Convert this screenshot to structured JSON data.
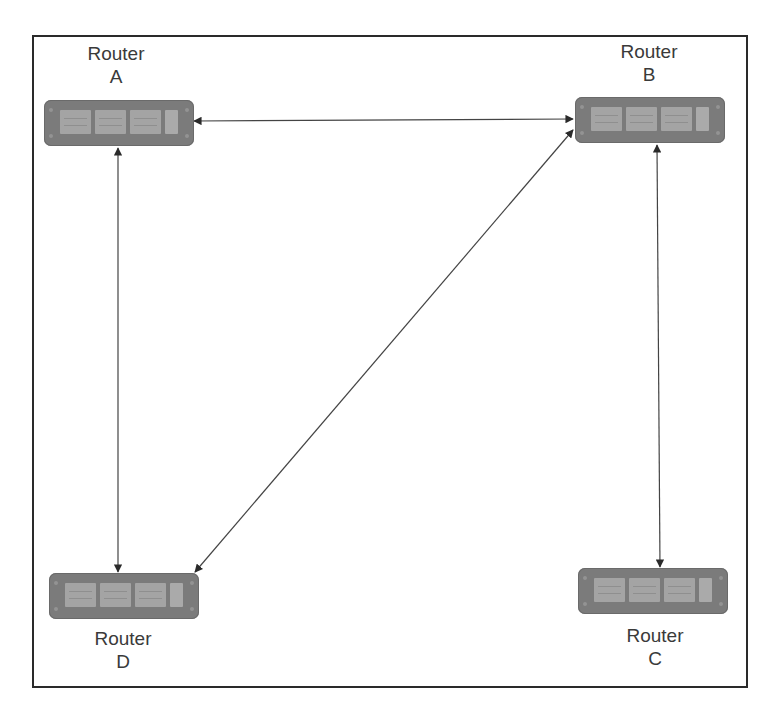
{
  "diagram": {
    "type": "network-topology",
    "routers": [
      {
        "id": "A",
        "label_line1": "Router",
        "label_line2": "A"
      },
      {
        "id": "B",
        "label_line1": "Router",
        "label_line2": "B"
      },
      {
        "id": "C",
        "label_line1": "Router",
        "label_line2": "C"
      },
      {
        "id": "D",
        "label_line1": "Router",
        "label_line2": "D"
      }
    ],
    "links": [
      {
        "from": "A",
        "to": "B",
        "bidirectional": true
      },
      {
        "from": "A",
        "to": "D",
        "bidirectional": true
      },
      {
        "from": "B",
        "to": "D",
        "bidirectional": true
      },
      {
        "from": "B",
        "to": "C",
        "bidirectional": true
      }
    ],
    "colors": {
      "router_body": "#7b7b7b",
      "router_port": "#a4a4a4",
      "link": "#333333",
      "frame": "#2a2a2a",
      "label": "#3a3a3a"
    }
  }
}
